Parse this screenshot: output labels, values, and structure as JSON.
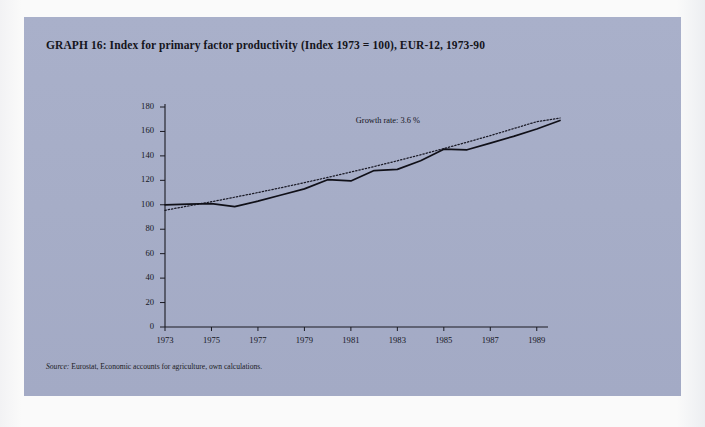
{
  "title": "GRAPH 16: Index for primary factor productivity (Index 1973 = 100), EUR-12, 1973-90",
  "source_label": "Source:",
  "source_text": " Eurostat, Economic accounts for agriculture, own calculations.",
  "colors": {
    "panel_background": "#a8afc9",
    "page_background": "#fafafa",
    "axis": "#1a1a22",
    "series_line": "#111118",
    "trend_line": "#1a1a26",
    "text": "#15151c"
  },
  "chart_data": {
    "type": "line",
    "title": "Index for primary factor productivity (Index 1973 = 100), EUR-12, 1973-90",
    "xlabel": "",
    "ylabel": "",
    "xlim": [
      1973,
      1990
    ],
    "ylim": [
      0,
      180
    ],
    "ytick_step": 20,
    "yticks": [
      0,
      20,
      40,
      60,
      80,
      100,
      120,
      140,
      160,
      180
    ],
    "xticks": [
      1973,
      1975,
      1977,
      1979,
      1981,
      1983,
      1985,
      1987,
      1989
    ],
    "xtick_labels": [
      "1973",
      "1975",
      "1977",
      "1979",
      "1981",
      "1983",
      "1985",
      "1987",
      "1989"
    ],
    "grid": false,
    "legend": "none",
    "annotations": [
      {
        "text": "Growth rate: 3.6 %",
        "x": 1985.0,
        "y": 168
      }
    ],
    "series": [
      {
        "name": "Index for primary factor productivity",
        "style": "solid",
        "x": [
          1973,
          1974,
          1975,
          1976,
          1977,
          1978,
          1979,
          1980,
          1981,
          1982,
          1983,
          1984,
          1985,
          1986,
          1987,
          1988,
          1989,
          1990
        ],
        "values": [
          100,
          100.5,
          101,
          98.5,
          103,
          108,
          113,
          120.5,
          119.5,
          128,
          129,
          136,
          145.5,
          145,
          150.5,
          156,
          162,
          169
        ]
      },
      {
        "name": "Trend (growth rate 3.6 %)",
        "style": "dotted",
        "x": [
          1973,
          1974,
          1975,
          1976,
          1977,
          1978,
          1979,
          1980,
          1981,
          1982,
          1983,
          1984,
          1985,
          1986,
          1987,
          1988,
          1989,
          1990
        ],
        "values": [
          95.5,
          99,
          102.5,
          106.2,
          110,
          114,
          118.1,
          122.4,
          126.8,
          131.3,
          136,
          140.9,
          146,
          151.2,
          156.6,
          162.3,
          168,
          171
        ]
      }
    ]
  }
}
